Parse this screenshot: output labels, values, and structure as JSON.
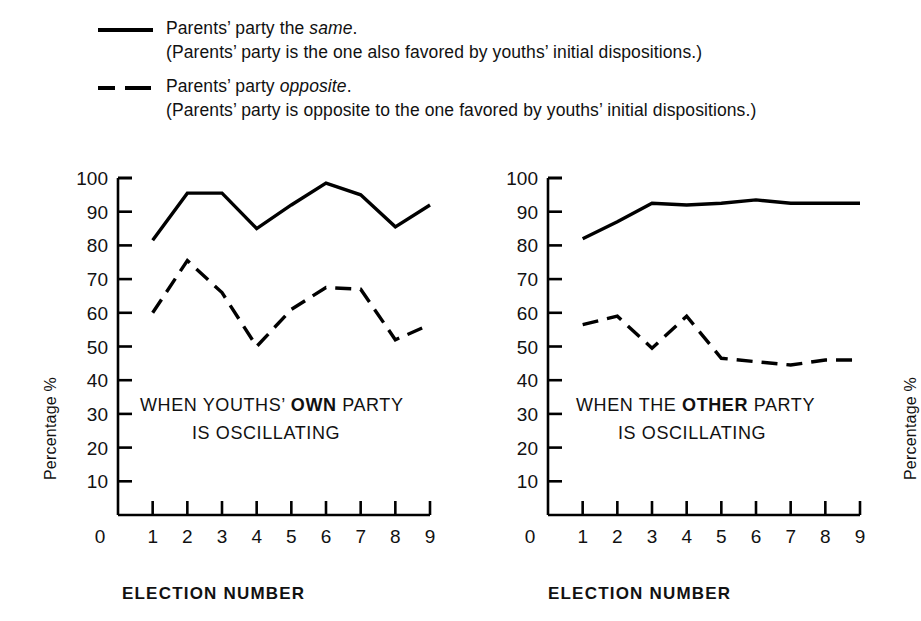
{
  "legend": {
    "entries": [
      {
        "style": "solid",
        "title_prefix": "Parents’ party the ",
        "title_emphasis": "same",
        "title_suffix": ".",
        "subtitle": "(Parents’ party is the one also favored by youths’ initial dispositions.)"
      },
      {
        "style": "dashed",
        "title_prefix": "Parents’ party ",
        "title_emphasis": "opposite",
        "title_suffix": ".",
        "subtitle": "(Parents’ party is opposite to the one favored by youths’ initial dispositions.)"
      }
    ]
  },
  "panels": {
    "left": {
      "annotation_line1_pre": "WHEN YOUTHS’ ",
      "annotation_line1_bold": "OWN",
      "annotation_line1_post": " PARTY",
      "annotation_line2": "IS OSCILLATING",
      "ylabel": "Percentage %",
      "xlabel": "ELECTION NUMBER"
    },
    "right": {
      "annotation_line1_pre": "WHEN THE ",
      "annotation_line1_bold": "OTHER",
      "annotation_line1_post": " PARTY",
      "annotation_line2": "IS OSCILLATING",
      "ylabel": "Percentage %",
      "xlabel": "ELECTION NUMBER"
    }
  },
  "chart_data": [
    {
      "type": "line",
      "title": "WHEN YOUTHS' OWN PARTY IS OSCILLATING",
      "xlabel": "ELECTION NUMBER",
      "ylabel": "Percentage %",
      "x": [
        1,
        2,
        3,
        4,
        5,
        6,
        7,
        8,
        9
      ],
      "xticks": [
        0,
        1,
        2,
        3,
        4,
        5,
        6,
        7,
        8,
        9
      ],
      "yticks": [
        0,
        10,
        20,
        30,
        40,
        50,
        60,
        70,
        80,
        90,
        100
      ],
      "xlim": [
        0,
        9
      ],
      "ylim": [
        0,
        100
      ],
      "grid": false,
      "legend_position": "above-figure",
      "series": [
        {
          "name": "Parents' party the same.",
          "style": "solid",
          "color": "#000000",
          "values": [
            81.5,
            95.5,
            95.5,
            85,
            92,
            98.5,
            95,
            85.5,
            92
          ]
        },
        {
          "name": "Parents' party opposite.",
          "style": "dashed",
          "color": "#000000",
          "values": [
            60,
            75.5,
            66,
            50,
            61,
            67.5,
            67,
            52,
            56.5
          ]
        }
      ]
    },
    {
      "type": "line",
      "title": "WHEN THE OTHER PARTY IS OSCILLATING",
      "xlabel": "ELECTION NUMBER",
      "ylabel": "Percentage %",
      "x": [
        1,
        2,
        3,
        4,
        5,
        6,
        7,
        8,
        9
      ],
      "xticks": [
        0,
        1,
        2,
        3,
        4,
        5,
        6,
        7,
        8,
        9
      ],
      "yticks": [
        0,
        10,
        20,
        30,
        40,
        50,
        60,
        70,
        80,
        90,
        100
      ],
      "xlim": [
        0,
        9
      ],
      "ylim": [
        0,
        100
      ],
      "grid": false,
      "legend_position": "above-figure",
      "series": [
        {
          "name": "Parents' party the same.",
          "style": "solid",
          "color": "#000000",
          "values": [
            82,
            87,
            92.5,
            92,
            92.5,
            93.5,
            92.5,
            92.5,
            92.5
          ]
        },
        {
          "name": "Parents' party opposite.",
          "style": "dashed",
          "color": "#000000",
          "values": [
            56.5,
            59,
            49.5,
            59,
            46.5,
            45.5,
            44.5,
            46,
            46
          ]
        }
      ]
    }
  ]
}
